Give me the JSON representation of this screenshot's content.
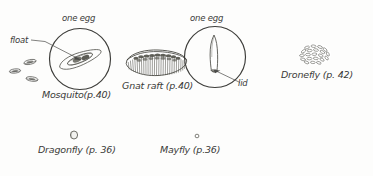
{
  "figure": {
    "type": "insect-egg-identification-plate",
    "background_color": "#fdfdfc",
    "ink_color": "#3a3a38",
    "width": 373,
    "height": 176
  },
  "mosquito": {
    "one_egg_label": "one egg",
    "float_label": "float",
    "caption": "Mosquito(p.40)",
    "loose_egg_count": 3,
    "detail_circle": {
      "cx": 80,
      "cy": 59,
      "r": 31
    }
  },
  "gnat": {
    "caption": "Gnat raft (p.40)"
  },
  "lidded_egg": {
    "one_egg_label": "one egg",
    "lid_label": "lid",
    "detail_circle": {
      "cx": 215,
      "cy": 57,
      "r": 31
    }
  },
  "dronefly": {
    "caption": "Dronefly (p. 42)"
  },
  "dragonfly": {
    "caption": "Dragonfly (p. 36)"
  },
  "mayfly": {
    "caption": "Mayfly (p.36)"
  }
}
